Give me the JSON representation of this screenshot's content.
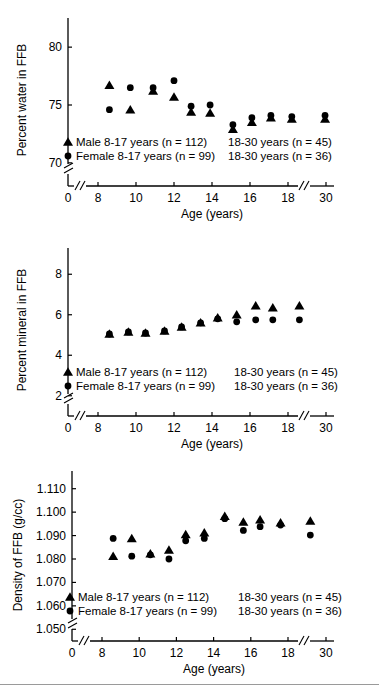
{
  "figure": {
    "background": "#ffffff",
    "marker_color": "#000000",
    "axis_color": "#000000"
  },
  "chart_data": [
    {
      "type": "scatter",
      "title": "",
      "xlabel": "Age (years)",
      "ylabel": "Percent water in FFB",
      "xlim": [
        8,
        30
      ],
      "ylim": [
        68,
        82
      ],
      "xticks": [
        0,
        8,
        10,
        12,
        14,
        16,
        18,
        30
      ],
      "xticklabels": [
        "0",
        "8",
        "10",
        "12",
        "14",
        "16",
        "18",
        "30"
      ],
      "yticks": [
        70,
        75,
        80
      ],
      "yticklabels": [
        "70",
        "75",
        "80"
      ],
      "grid": false,
      "axis_breaks": {
        "x": [
          "after-0",
          "before-30"
        ],
        "y": [
          "below-70"
        ]
      },
      "legend_position": "lower-left-inside",
      "legend": [
        {
          "marker": "triangle",
          "label": "Male 8-17 years (n = 112)",
          "label2": "18-30 years (n = 45)"
        },
        {
          "marker": "circle",
          "label": "Female 8-17 years (n = 99)",
          "label2": "18-30 years (n = 36)"
        }
      ],
      "series": [
        {
          "name": "Male",
          "marker": "triangle",
          "points": [
            {
              "x": 8.6,
              "y": 76.7
            },
            {
              "x": 9.7,
              "y": 74.6
            },
            {
              "x": 10.9,
              "y": 76.2
            },
            {
              "x": 12.0,
              "y": 75.7
            },
            {
              "x": 12.9,
              "y": 74.4
            },
            {
              "x": 13.9,
              "y": 74.3
            },
            {
              "x": 15.1,
              "y": 72.9
            },
            {
              "x": 16.1,
              "y": 73.5
            },
            {
              "x": 17.1,
              "y": 73.9
            },
            {
              "x": 18.2,
              "y": 73.8
            },
            {
              "x": 29.7,
              "y": 73.8
            }
          ]
        },
        {
          "name": "Female",
          "marker": "circle",
          "points": [
            {
              "x": 8.6,
              "y": 74.6
            },
            {
              "x": 9.7,
              "y": 76.5
            },
            {
              "x": 10.9,
              "y": 76.5
            },
            {
              "x": 12.0,
              "y": 77.1
            },
            {
              "x": 12.9,
              "y": 74.9
            },
            {
              "x": 13.9,
              "y": 75.0
            },
            {
              "x": 15.1,
              "y": 73.3
            },
            {
              "x": 16.1,
              "y": 73.9
            },
            {
              "x": 17.1,
              "y": 74.1
            },
            {
              "x": 18.2,
              "y": 74.0
            },
            {
              "x": 29.7,
              "y": 74.1
            }
          ]
        }
      ]
    },
    {
      "type": "scatter",
      "title": "",
      "xlabel": "Age (years)",
      "ylabel": "Percent mineral in FFB",
      "xlim": [
        8,
        30
      ],
      "ylim": [
        1,
        9
      ],
      "xticks": [
        0,
        8,
        10,
        12,
        14,
        16,
        18,
        30
      ],
      "xticklabels": [
        "0",
        "8",
        "10",
        "12",
        "14",
        "16",
        "18",
        "30"
      ],
      "yticks": [
        2,
        4,
        6,
        8
      ],
      "yticklabels": [
        "2",
        "4",
        "6",
        "8"
      ],
      "grid": false,
      "axis_breaks": {
        "x": [
          "after-0",
          "before-30"
        ],
        "y": [
          "below-2"
        ]
      },
      "legend_position": "lower-left-inside",
      "legend": [
        {
          "marker": "triangle",
          "label": "Male 8-17 years (n = 112)",
          "label2": "18-30 years (n = 45)"
        },
        {
          "marker": "circle",
          "label": "Female 8-17 years (n = 99)",
          "label2": "18-30 years (n = 36)"
        }
      ],
      "series": [
        {
          "name": "Male",
          "marker": "triangle",
          "points": [
            {
              "x": 8.6,
              "y": 5.05
            },
            {
              "x": 9.6,
              "y": 5.15
            },
            {
              "x": 10.5,
              "y": 5.1
            },
            {
              "x": 11.5,
              "y": 5.2
            },
            {
              "x": 12.4,
              "y": 5.4
            },
            {
              "x": 13.4,
              "y": 5.6
            },
            {
              "x": 14.3,
              "y": 5.85
            },
            {
              "x": 15.3,
              "y": 6.0
            },
            {
              "x": 16.3,
              "y": 6.45
            },
            {
              "x": 17.2,
              "y": 6.35
            },
            {
              "x": 18.6,
              "y": 6.45
            }
          ]
        },
        {
          "name": "Female",
          "marker": "circle",
          "points": [
            {
              "x": 8.6,
              "y": 5.05
            },
            {
              "x": 9.6,
              "y": 5.15
            },
            {
              "x": 10.5,
              "y": 5.1
            },
            {
              "x": 11.5,
              "y": 5.2
            },
            {
              "x": 12.4,
              "y": 5.4
            },
            {
              "x": 13.4,
              "y": 5.6
            },
            {
              "x": 14.3,
              "y": 5.8
            },
            {
              "x": 15.3,
              "y": 5.65
            },
            {
              "x": 16.3,
              "y": 5.75
            },
            {
              "x": 17.2,
              "y": 5.75
            },
            {
              "x": 18.6,
              "y": 5.75
            }
          ]
        }
      ]
    },
    {
      "type": "scatter",
      "title": "",
      "xlabel": "Age (years)",
      "ylabel": "Density of FFB (g/cc)",
      "xlim": [
        8,
        30
      ],
      "ylim": [
        1.045,
        1.115
      ],
      "xticks": [
        0,
        8,
        10,
        12,
        14,
        16,
        18,
        30
      ],
      "xticklabels": [
        "0",
        "8",
        "10",
        "12",
        "14",
        "16",
        "18",
        "30"
      ],
      "yticks": [
        1.05,
        1.06,
        1.07,
        1.08,
        1.09,
        1.1,
        1.11
      ],
      "yticklabels": [
        "1.050",
        "1.060",
        "1.070",
        "1.080",
        "1.090",
        "1.100",
        "1.110"
      ],
      "grid": false,
      "axis_breaks": {
        "x": [
          "after-0",
          "before-30"
        ],
        "y": [
          "below-1.050"
        ]
      },
      "legend_position": "lower-left-inside",
      "legend": [
        {
          "marker": "triangle",
          "label": "Male 8-17 years (n = 112)",
          "label2": "18-30 years (n = 45)"
        },
        {
          "marker": "circle",
          "label": "Female 8-17 years (n = 99)",
          "label2": "18-30 years (n = 36)"
        }
      ],
      "series": [
        {
          "name": "Male",
          "marker": "triangle",
          "points": [
            {
              "x": 8.6,
              "y": 1.0812
            },
            {
              "x": 9.6,
              "y": 1.0888
            },
            {
              "x": 10.6,
              "y": 1.0822
            },
            {
              "x": 11.6,
              "y": 1.0838
            },
            {
              "x": 12.5,
              "y": 1.0905
            },
            {
              "x": 13.5,
              "y": 1.0912
            },
            {
              "x": 14.6,
              "y": 1.0983
            },
            {
              "x": 15.6,
              "y": 1.0958
            },
            {
              "x": 16.5,
              "y": 1.0968
            },
            {
              "x": 17.6,
              "y": 1.0955
            },
            {
              "x": 19.2,
              "y": 1.0962
            }
          ]
        },
        {
          "name": "Female",
          "marker": "circle",
          "points": [
            {
              "x": 8.6,
              "y": 1.0888
            },
            {
              "x": 9.6,
              "y": 1.0812
            },
            {
              "x": 10.6,
              "y": 1.0818
            },
            {
              "x": 11.6,
              "y": 1.08
            },
            {
              "x": 12.5,
              "y": 1.0878
            },
            {
              "x": 13.5,
              "y": 1.0888
            },
            {
              "x": 14.6,
              "y": 1.0972
            },
            {
              "x": 15.6,
              "y": 1.0922
            },
            {
              "x": 16.5,
              "y": 1.0938
            },
            {
              "x": 17.6,
              "y": 1.0945
            },
            {
              "x": 19.2,
              "y": 1.0902
            }
          ]
        }
      ]
    }
  ]
}
